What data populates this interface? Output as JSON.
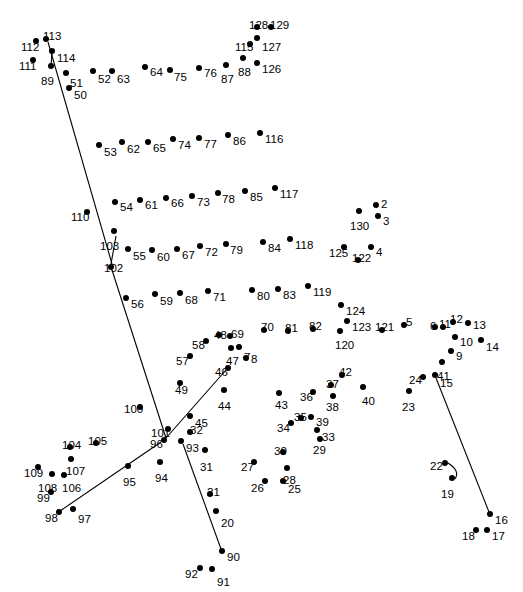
{
  "style": {
    "background": "#ffffff",
    "dot_color": "#000000",
    "label_color": "#000000",
    "line_color": "#000000"
  },
  "chart_data": {
    "type": "scatter",
    "xlabel": "",
    "ylabel": "",
    "xlim": [
      0,
      523
    ],
    "ylim": [
      0,
      592
    ],
    "grid": false,
    "legend": null,
    "note": "Numbered dot-to-dot puzzle; each point carries a number label. Several partial guide lines are already drawn.",
    "points": [
      {
        "n": "2",
        "x": 376,
        "y": 205,
        "lx": 381,
        "ly": 199
      },
      {
        "n": "3",
        "x": 378,
        "y": 216,
        "lx": 383,
        "ly": 216
      },
      {
        "n": "4",
        "x": 371,
        "y": 247,
        "lx": 376,
        "ly": 247
      },
      {
        "n": "5",
        "x": 404,
        "y": 325,
        "lx": 406,
        "ly": 317
      },
      {
        "n": "6",
        "x": 435,
        "y": 327,
        "lx": 430,
        "ly": 321
      },
      {
        "n": "7",
        "x": 239,
        "y": 347,
        "lx": 244,
        "ly": 352
      },
      {
        "n": "8",
        "x": 246,
        "y": 358,
        "lx": 251,
        "ly": 354
      },
      {
        "n": "9",
        "x": 451,
        "y": 351,
        "lx": 456,
        "ly": 351
      },
      {
        "n": "10",
        "x": 455,
        "y": 337,
        "lx": 460,
        "ly": 337
      },
      {
        "n": "11",
        "x": 443,
        "y": 327,
        "lx": 439,
        "ly": 319
      },
      {
        "n": "12",
        "x": 453,
        "y": 322,
        "lx": 450,
        "ly": 314
      },
      {
        "n": "13",
        "x": 468,
        "y": 323,
        "lx": 473,
        "ly": 320
      },
      {
        "n": "14",
        "x": 481,
        "y": 340,
        "lx": 486,
        "ly": 342
      },
      {
        "n": "15",
        "x": 435,
        "y": 375,
        "lx": 440,
        "ly": 378
      },
      {
        "n": "16",
        "x": 490,
        "y": 514,
        "lx": 495,
        "ly": 515
      },
      {
        "n": "17",
        "x": 487,
        "y": 530,
        "lx": 492,
        "ly": 531
      },
      {
        "n": "18",
        "x": 476,
        "y": 530,
        "lx": 462,
        "ly": 531
      },
      {
        "n": "19",
        "x": 452,
        "y": 478,
        "lx": 441,
        "ly": 489
      },
      {
        "n": "20",
        "x": 216,
        "y": 511,
        "lx": 221,
        "ly": 518
      },
      {
        "n": "21",
        "x": 210,
        "y": 494,
        "lx": 207,
        "ly": 487
      },
      {
        "n": "22",
        "x": 445,
        "y": 463,
        "lx": 430,
        "ly": 461
      },
      {
        "n": "23",
        "x": 409,
        "y": 391,
        "lx": 402,
        "ly": 402
      },
      {
        "n": "24",
        "x": 423,
        "y": 377,
        "lx": 409,
        "ly": 375
      },
      {
        "n": "25",
        "x": 283,
        "y": 481,
        "lx": 288,
        "ly": 484
      },
      {
        "n": "26",
        "x": 265,
        "y": 481,
        "lx": 251,
        "ly": 483
      },
      {
        "n": "27",
        "x": 254,
        "y": 462,
        "lx": 241,
        "ly": 462
      },
      {
        "n": "28",
        "x": 287,
        "y": 468,
        "lx": 283,
        "ly": 475
      },
      {
        "n": "29",
        "x": 320,
        "y": 439,
        "lx": 313,
        "ly": 445
      },
      {
        "n": "30",
        "x": 283,
        "y": 452,
        "lx": 274,
        "ly": 446
      },
      {
        "n": "31",
        "x": 205,
        "y": 450,
        "lx": 200,
        "ly": 462
      },
      {
        "n": "32",
        "x": 190,
        "y": 432,
        "lx": 190,
        "ly": 425
      },
      {
        "n": "33",
        "x": 317,
        "y": 430,
        "lx": 322,
        "ly": 432
      },
      {
        "n": "34",
        "x": 291,
        "y": 423,
        "lx": 277,
        "ly": 423
      },
      {
        "n": "35",
        "x": 301,
        "y": 418,
        "lx": 294,
        "ly": 412
      },
      {
        "n": "36",
        "x": 313,
        "y": 392,
        "lx": 300,
        "ly": 392
      },
      {
        "n": "37",
        "x": 331,
        "y": 385,
        "lx": 326,
        "ly": 379
      },
      {
        "n": "38",
        "x": 333,
        "y": 396,
        "lx": 326,
        "ly": 402
      },
      {
        "n": "39",
        "x": 311,
        "y": 417,
        "lx": 316,
        "ly": 417
      },
      {
        "n": "40",
        "x": 363,
        "y": 387,
        "lx": 362,
        "ly": 396
      },
      {
        "n": "41",
        "x": 442,
        "y": 362,
        "lx": 437,
        "ly": 371
      },
      {
        "n": "42",
        "x": 342,
        "y": 375,
        "lx": 339,
        "ly": 367
      },
      {
        "n": "43",
        "x": 279,
        "y": 393,
        "lx": 275,
        "ly": 400
      },
      {
        "n": "44",
        "x": 224,
        "y": 390,
        "lx": 218,
        "ly": 401
      },
      {
        "n": "45",
        "x": 190,
        "y": 416,
        "lx": 195,
        "ly": 418
      },
      {
        "n": "46",
        "x": 228,
        "y": 368,
        "lx": 215,
        "ly": 367
      },
      {
        "n": "47",
        "x": 231,
        "y": 348,
        "lx": 226,
        "ly": 356
      },
      {
        "n": "48",
        "x": 219,
        "y": 335,
        "lx": 214,
        "ly": 330
      },
      {
        "n": "49",
        "x": 180,
        "y": 383,
        "lx": 175,
        "ly": 385
      },
      {
        "n": "50",
        "x": 69,
        "y": 88,
        "lx": 74,
        "ly": 90
      },
      {
        "n": "51",
        "x": 66,
        "y": 73,
        "lx": 70,
        "ly": 78
      },
      {
        "n": "52",
        "x": 93,
        "y": 71,
        "lx": 98,
        "ly": 74
      },
      {
        "n": "53",
        "x": 99,
        "y": 145,
        "lx": 104,
        "ly": 147
      },
      {
        "n": "54",
        "x": 115,
        "y": 202,
        "lx": 120,
        "ly": 202
      },
      {
        "n": "55",
        "x": 128,
        "y": 249,
        "lx": 133,
        "ly": 251
      },
      {
        "n": "56",
        "x": 126,
        "y": 298,
        "lx": 131,
        "ly": 299
      },
      {
        "n": "57",
        "x": 190,
        "y": 356,
        "lx": 176,
        "ly": 356
      },
      {
        "n": "58",
        "x": 206,
        "y": 341,
        "lx": 192,
        "ly": 340
      },
      {
        "n": "59",
        "x": 155,
        "y": 294,
        "lx": 160,
        "ly": 296
      },
      {
        "n": "60",
        "x": 152,
        "y": 250,
        "lx": 157,
        "ly": 252
      },
      {
        "n": "61",
        "x": 140,
        "y": 200,
        "lx": 145,
        "ly": 200
      },
      {
        "n": "62",
        "x": 122,
        "y": 142,
        "lx": 127,
        "ly": 144
      },
      {
        "n": "63",
        "x": 112,
        "y": 71,
        "lx": 117,
        "ly": 74
      },
      {
        "n": "64",
        "x": 145,
        "y": 67,
        "lx": 150,
        "ly": 67
      },
      {
        "n": "65",
        "x": 148,
        "y": 142,
        "lx": 153,
        "ly": 143
      },
      {
        "n": "66",
        "x": 166,
        "y": 198,
        "lx": 171,
        "ly": 198
      },
      {
        "n": "67",
        "x": 177,
        "y": 249,
        "lx": 182,
        "ly": 250
      },
      {
        "n": "68",
        "x": 180,
        "y": 293,
        "lx": 185,
        "ly": 295
      },
      {
        "n": "69",
        "x": 230,
        "y": 336,
        "lx": 231,
        "ly": 329
      },
      {
        "n": "70",
        "x": 264,
        "y": 330,
        "lx": 261,
        "ly": 322
      },
      {
        "n": "71",
        "x": 208,
        "y": 291,
        "lx": 213,
        "ly": 292
      },
      {
        "n": "72",
        "x": 200,
        "y": 246,
        "lx": 205,
        "ly": 247
      },
      {
        "n": "73",
        "x": 192,
        "y": 196,
        "lx": 197,
        "ly": 197
      },
      {
        "n": "74",
        "x": 173,
        "y": 139,
        "lx": 178,
        "ly": 140
      },
      {
        "n": "75",
        "x": 170,
        "y": 70,
        "lx": 174,
        "ly": 72
      },
      {
        "n": "76",
        "x": 199,
        "y": 68,
        "lx": 204,
        "ly": 68
      },
      {
        "n": "77",
        "x": 199,
        "y": 138,
        "lx": 204,
        "ly": 139
      },
      {
        "n": "78",
        "x": 218,
        "y": 193,
        "lx": 222,
        "ly": 194
      },
      {
        "n": "79",
        "x": 226,
        "y": 244,
        "lx": 230,
        "ly": 245
      },
      {
        "n": "80",
        "x": 252,
        "y": 290,
        "lx": 257,
        "ly": 291
      },
      {
        "n": "81",
        "x": 288,
        "y": 331,
        "lx": 285,
        "ly": 323
      },
      {
        "n": "82",
        "x": 313,
        "y": 329,
        "lx": 309,
        "ly": 321
      },
      {
        "n": "83",
        "x": 278,
        "y": 289,
        "lx": 283,
        "ly": 290
      },
      {
        "n": "84",
        "x": 263,
        "y": 242,
        "lx": 268,
        "ly": 243
      },
      {
        "n": "85",
        "x": 245,
        "y": 191,
        "lx": 250,
        "ly": 192
      },
      {
        "n": "86",
        "x": 228,
        "y": 135,
        "lx": 233,
        "ly": 136
      },
      {
        "n": "87",
        "x": 226,
        "y": 65,
        "lx": 221,
        "ly": 74
      },
      {
        "n": "88",
        "x": 243,
        "y": 58,
        "lx": 238,
        "ly": 67
      },
      {
        "n": "89",
        "x": 51,
        "y": 66,
        "lx": 41,
        "ly": 76
      },
      {
        "n": "90",
        "x": 222,
        "y": 551,
        "lx": 227,
        "ly": 552
      },
      {
        "n": "91",
        "x": 212,
        "y": 569,
        "lx": 217,
        "ly": 577
      },
      {
        "n": "92",
        "x": 200,
        "y": 568,
        "lx": 185,
        "ly": 569
      },
      {
        "n": "93",
        "x": 181,
        "y": 441,
        "lx": 186,
        "ly": 443
      },
      {
        "n": "94",
        "x": 160,
        "y": 462,
        "lx": 155,
        "ly": 473
      },
      {
        "n": "95",
        "x": 128,
        "y": 466,
        "lx": 123,
        "ly": 477
      },
      {
        "n": "96",
        "x": 164,
        "y": 440,
        "lx": 150,
        "ly": 439
      },
      {
        "n": "97",
        "x": 73,
        "y": 509,
        "lx": 78,
        "ly": 514
      },
      {
        "n": "98",
        "x": 59,
        "y": 512,
        "lx": 45,
        "ly": 513
      },
      {
        "n": "99",
        "x": 51,
        "y": 492,
        "lx": 37,
        "ly": 493
      },
      {
        "n": "100",
        "x": 140,
        "y": 407,
        "lx": 124,
        "ly": 404
      },
      {
        "n": "101",
        "x": 168,
        "y": 429,
        "lx": 151,
        "ly": 428
      },
      {
        "n": "102",
        "x": 111,
        "y": 267,
        "lx": 104,
        "ly": 263
      },
      {
        "n": "103",
        "x": 114,
        "y": 231,
        "lx": 100,
        "ly": 241
      },
      {
        "n": "104",
        "x": 70,
        "y": 447,
        "lx": 62,
        "ly": 440
      },
      {
        "n": "105",
        "x": 96,
        "y": 443,
        "lx": 88,
        "ly": 436
      },
      {
        "n": "106",
        "x": 64,
        "y": 475,
        "lx": 62,
        "ly": 483
      },
      {
        "n": "107",
        "x": 71,
        "y": 459,
        "lx": 66,
        "ly": 466
      },
      {
        "n": "108",
        "x": 52,
        "y": 474,
        "lx": 38,
        "ly": 483
      },
      {
        "n": "109",
        "x": 38,
        "y": 467,
        "lx": 24,
        "ly": 468
      },
      {
        "n": "110",
        "x": 87,
        "y": 212,
        "lx": 71,
        "ly": 212
      },
      {
        "n": "111",
        "x": 33,
        "y": 60,
        "lx": 19,
        "ly": 61
      },
      {
        "n": "112",
        "x": 36,
        "y": 41,
        "lx": 21,
        "ly": 42
      },
      {
        "n": "113",
        "x": 46,
        "y": 39,
        "lx": 43,
        "ly": 31
      },
      {
        "n": "114",
        "x": 52,
        "y": 51,
        "lx": 57,
        "ly": 53
      },
      {
        "n": "115",
        "x": 250,
        "y": 44,
        "lx": 235,
        "ly": 42
      },
      {
        "n": "116",
        "x": 260,
        "y": 133,
        "lx": 265,
        "ly": 134
      },
      {
        "n": "117",
        "x": 275,
        "y": 188,
        "lx": 280,
        "ly": 189
      },
      {
        "n": "118",
        "x": 290,
        "y": 239,
        "lx": 295,
        "ly": 240
      },
      {
        "n": "119",
        "x": 308,
        "y": 286,
        "lx": 313,
        "ly": 287
      },
      {
        "n": "120",
        "x": 340,
        "y": 331,
        "lx": 335,
        "ly": 340
      },
      {
        "n": "121",
        "x": 382,
        "y": 330,
        "lx": 375,
        "ly": 322
      },
      {
        "n": "122",
        "x": 358,
        "y": 260,
        "lx": 352,
        "ly": 253
      },
      {
        "n": "123",
        "x": 347,
        "y": 321,
        "lx": 352,
        "ly": 322
      },
      {
        "n": "124",
        "x": 341,
        "y": 305,
        "lx": 346,
        "ly": 306
      },
      {
        "n": "125",
        "x": 344,
        "y": 247,
        "lx": 329,
        "ly": 248
      },
      {
        "n": "126",
        "x": 257,
        "y": 63,
        "lx": 262,
        "ly": 64
      },
      {
        "n": "127",
        "x": 257,
        "y": 38,
        "lx": 262,
        "ly": 42
      },
      {
        "n": "128",
        "x": 257,
        "y": 27,
        "lx": 249,
        "ly": 20
      },
      {
        "n": "129",
        "x": 271,
        "y": 27,
        "lx": 270,
        "ly": 20
      },
      {
        "n": "130",
        "x": 359,
        "y": 211,
        "lx": 350,
        "ly": 221
      }
    ],
    "guide_lines": [
      {
        "name": "line-113-to-102",
        "x1": 48,
        "y1": 42,
        "x2": 112,
        "y2": 264
      },
      {
        "name": "line-114-to-89",
        "x1": 52,
        "y1": 53,
        "x2": 51,
        "y2": 66
      },
      {
        "name": "line-103-to-102",
        "x1": 116,
        "y1": 236,
        "x2": 111,
        "y2": 264
      },
      {
        "name": "line-102-to-96",
        "x1": 112,
        "y1": 270,
        "x2": 166,
        "y2": 438
      },
      {
        "name": "line-46-to-96",
        "x1": 226,
        "y1": 370,
        "x2": 166,
        "y2": 438
      },
      {
        "name": "line-96-to-98",
        "x1": 161,
        "y1": 442,
        "x2": 60,
        "y2": 511
      },
      {
        "name": "line-93-to-90",
        "x1": 183,
        "y1": 444,
        "x2": 221,
        "y2": 549
      },
      {
        "name": "line-15-to-16",
        "x1": 436,
        "y1": 378,
        "x2": 489,
        "y2": 512
      },
      {
        "name": "arc-22-to-19",
        "x1": 448,
        "y1": 463,
        "x2": 455,
        "y2": 479,
        "curve": true
      }
    ]
  }
}
